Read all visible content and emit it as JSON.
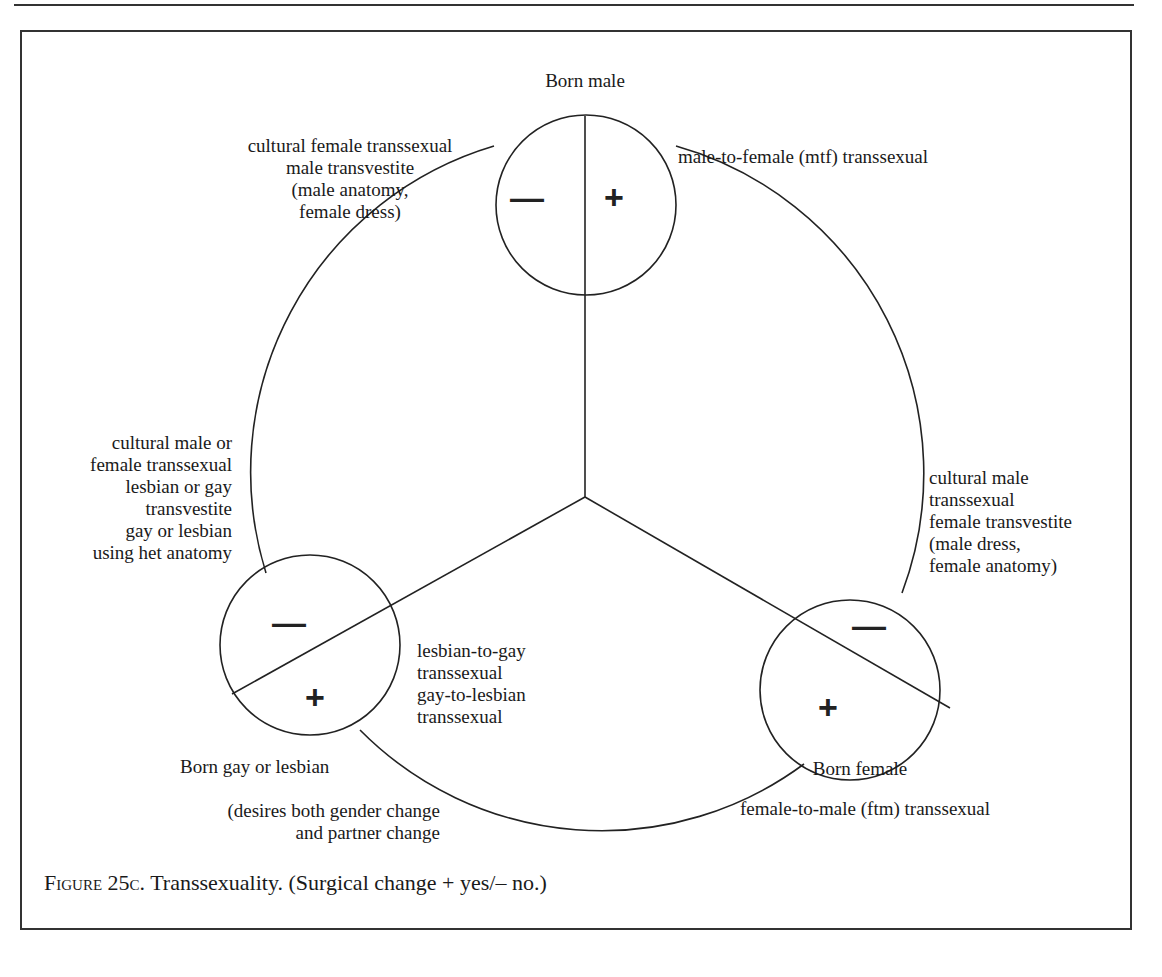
{
  "figure": {
    "caption_label": "Figure 25c.",
    "caption_text": " Transsexuality. (Surgical change + yes/– no.)"
  },
  "nodes": {
    "top": {
      "title": "Born male",
      "minus": "—",
      "plus": "+",
      "plus_label": "male-to-female (mtf) transsexual",
      "minus_label": "cultural female transsexual\nmale transvestite\n(male anatomy,\nfemale dress)"
    },
    "bottom_left": {
      "title": "Born gay or lesbian",
      "subtitle": "(desires both gender change\nand partner change",
      "minus": "—",
      "plus": "+",
      "plus_label": "lesbian-to-gay\ntranssexual\ngay-to-lesbian\ntranssexual",
      "minus_label": "cultural male or\nfemale transsexual\nlesbian or gay\ntransvestite\ngay or lesbian\nusing het anatomy"
    },
    "bottom_right": {
      "title": "Born female",
      "minus": "—",
      "plus": "+",
      "plus_label": "female-to-male (ftm) transsexual",
      "minus_label": "cultural male\ntranssexual\nfemale transvestite\n(male dress,\nfemale anatomy)"
    }
  },
  "colors": {
    "line": "#222222",
    "background": "#ffffff",
    "text": "#1a1a1a"
  }
}
